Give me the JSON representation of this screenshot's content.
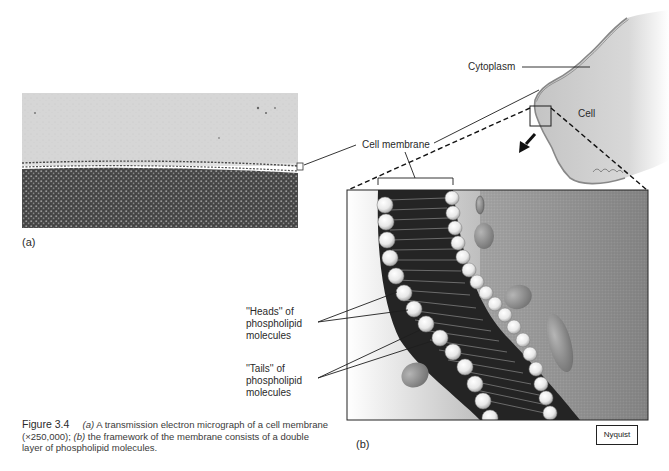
{
  "figure": {
    "number": "Figure 3.4",
    "caption": {
      "part_a_marker": "(a)",
      "part_a_text": " A transmission electron micrograph of a cell membrane (×250,000); ",
      "part_b_marker": "(b)",
      "part_b_text": " the framework of the membrane consists of a double layer of phospholipid molecules."
    },
    "magnification": "×250,000"
  },
  "panel_a": {
    "label": "(a)",
    "type": "transmission electron micrograph"
  },
  "panel_b": {
    "label": "(b)",
    "artist_credit": "Nyquist"
  },
  "labels": {
    "cytoplasm": "Cytoplasm",
    "cell": "Cell",
    "cell_membrane": "Cell membrane",
    "heads": [
      "''Heads'' of",
      "phospholipid",
      "molecules"
    ],
    "tails": [
      "''Tails'' of",
      "phospholipid",
      "molecules"
    ]
  },
  "colors": {
    "line": "#1e1e1e",
    "micrograph_light": "#d4d4d4",
    "micrograph_dark": "#3c3c3c",
    "cell_fill": "#c8c8c8",
    "protein": "#8a8a8a"
  }
}
